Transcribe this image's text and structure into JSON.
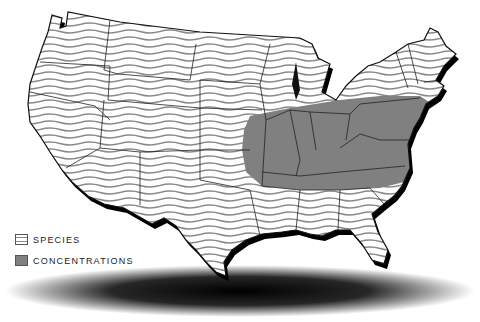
{
  "map": {
    "title": "",
    "region": "Contiguous United States",
    "colors": {
      "background": "#ffffff",
      "species_stripe": "#888888",
      "concentration_fill": "#808080",
      "border": "#222222",
      "shadow": "#000000"
    }
  },
  "legend": {
    "items": [
      {
        "label": "SPECIES",
        "pattern": "striped"
      },
      {
        "label": "CONCENTRATIONS",
        "pattern": "solid-gray"
      }
    ]
  }
}
